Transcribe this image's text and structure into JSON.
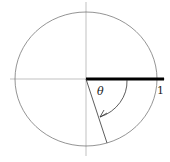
{
  "diagram": {
    "type": "unit-circle-angle",
    "labels": {
      "theta": "θ",
      "one": "1"
    },
    "colors": {
      "stroke": "#555555",
      "thick": "#000000"
    }
  }
}
